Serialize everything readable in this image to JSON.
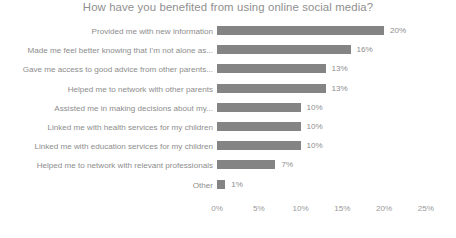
{
  "chart_data": {
    "type": "bar",
    "orientation": "horizontal",
    "title": "How have you benefited from using online social media?",
    "xlabel": "",
    "ylabel": "",
    "xlim": [
      0,
      25
    ],
    "grid": false,
    "legend": "none",
    "bar_color": "#848484",
    "text_color": "#8d8d8d",
    "title_color": "#8f8f8f",
    "background": "#ffffff",
    "categories": [
      "Provided me with new information",
      "Made me feel better knowing that I'm not alone as...",
      "Gave me access to good advice from other parents...",
      "Helped me to network with other parents",
      "Assisted me in making decisions about my...",
      "Linked me with health services for my children",
      "Linked me with education services for my children",
      "Helped me to network with relevant professionals",
      "Other"
    ],
    "values": [
      20,
      16,
      13,
      13,
      10,
      10,
      10,
      7,
      1
    ],
    "data_labels": [
      "20%",
      "16%",
      "13%",
      "13%",
      "10%",
      "10%",
      "10%",
      "7%",
      "1%"
    ],
    "xticks": [
      0,
      5,
      10,
      15,
      20,
      25
    ],
    "xticklabels": [
      "0%",
      "5%",
      "10%",
      "15%",
      "20%",
      "25%"
    ]
  }
}
